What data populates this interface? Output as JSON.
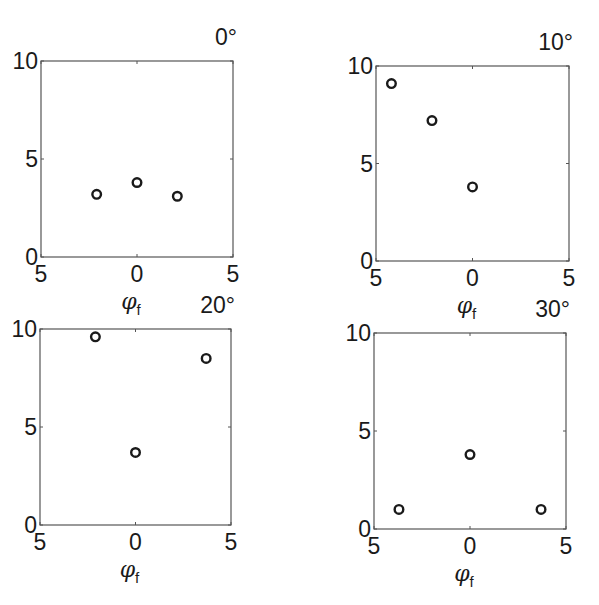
{
  "chart_data": [
    {
      "type": "scatter",
      "title": "0°",
      "xlabel": "φ",
      "xlabel_subscript": "f",
      "ylabel": "",
      "xlim": [
        -5,
        5
      ],
      "ylim": [
        0,
        10
      ],
      "xtick_labels": [
        "5",
        "0",
        "5"
      ],
      "xticks": [
        -5,
        0,
        5
      ],
      "ytick_labels": [
        "0",
        "5",
        "10"
      ],
      "yticks": [
        0,
        5,
        10
      ],
      "grid": false,
      "marker": "open-circle",
      "points": [
        {
          "x": -2.1,
          "y": 3.2
        },
        {
          "x": 0.0,
          "y": 3.8
        },
        {
          "x": 2.1,
          "y": 3.1
        }
      ],
      "box": {
        "left": 41,
        "top": 61,
        "right": 233,
        "bottom": 257
      }
    },
    {
      "type": "scatter",
      "title": "10°",
      "xlabel": "φ",
      "xlabel_subscript": "f",
      "ylabel": "",
      "xlim": [
        -5,
        5
      ],
      "ylim": [
        0,
        10
      ],
      "xtick_labels": [
        "5",
        "0",
        "5"
      ],
      "xticks": [
        -5,
        0,
        5
      ],
      "ytick_labels": [
        "0",
        "5",
        "10"
      ],
      "yticks": [
        0,
        5,
        10
      ],
      "grid": false,
      "marker": "open-circle",
      "points": [
        {
          "x": -4.2,
          "y": 9.1
        },
        {
          "x": -2.1,
          "y": 7.2
        },
        {
          "x": 0.0,
          "y": 3.8
        }
      ],
      "box": {
        "left": 376,
        "top": 66,
        "right": 569,
        "bottom": 261
      }
    },
    {
      "type": "scatter",
      "title": "20°",
      "xlabel": "φ",
      "xlabel_subscript": "f",
      "ylabel": "",
      "xlim": [
        -5,
        5
      ],
      "ylim": [
        0,
        10
      ],
      "xtick_labels": [
        "5",
        "0",
        "5"
      ],
      "xticks": [
        -5,
        0,
        5
      ],
      "ytick_labels": [
        "0",
        "5",
        "10"
      ],
      "yticks": [
        0,
        5,
        10
      ],
      "grid": false,
      "marker": "open-circle",
      "points": [
        {
          "x": -2.1,
          "y": 9.6
        },
        {
          "x": 0.0,
          "y": 3.7
        },
        {
          "x": 3.7,
          "y": 8.5
        }
      ],
      "box": {
        "left": 40,
        "top": 329,
        "right": 231,
        "bottom": 525
      }
    },
    {
      "type": "scatter",
      "title": "30°",
      "xlabel": "φ",
      "xlabel_subscript": "f",
      "ylabel": "",
      "xlim": [
        -5,
        5
      ],
      "ylim": [
        0,
        10
      ],
      "xtick_labels": [
        "5",
        "0",
        "5"
      ],
      "xticks": [
        -5,
        0,
        5
      ],
      "ytick_labels": [
        "0",
        "5",
        "10"
      ],
      "yticks": [
        0,
        5,
        10
      ],
      "grid": false,
      "marker": "open-circle",
      "points": [
        {
          "x": -3.7,
          "y": 1.0
        },
        {
          "x": 0.0,
          "y": 3.8
        },
        {
          "x": 3.7,
          "y": 1.0
        }
      ],
      "box": {
        "left": 374,
        "top": 333,
        "right": 566,
        "bottom": 529
      }
    }
  ]
}
